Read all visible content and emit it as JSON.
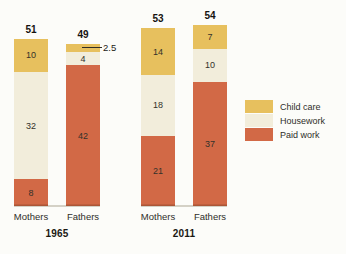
{
  "chart_data": {
    "type": "bar",
    "stacked": true,
    "series_order_top_to_bottom": [
      "Child care",
      "Housework",
      "Paid work"
    ],
    "series_colors": {
      "Child care": "#E7C05E",
      "Housework": "#F2EDDB",
      "Paid work": "#D26946"
    },
    "groups": [
      {
        "year_label": "1965",
        "bars": [
          {
            "category": "Mothers",
            "total": 51,
            "total_label": "51",
            "segments": [
              {
                "series": "Child care",
                "value": 10,
                "label": "10"
              },
              {
                "series": "Housework",
                "value": 32,
                "label": "32"
              },
              {
                "series": "Paid work",
                "value": 8,
                "label": "8"
              }
            ]
          },
          {
            "category": "Fathers",
            "total": 49,
            "total_label": "49",
            "segments": [
              {
                "series": "Child care",
                "value": 2.5,
                "label": "",
                "callout_label": "2.5"
              },
              {
                "series": "Housework",
                "value": 4,
                "label": "4"
              },
              {
                "series": "Paid work",
                "value": 42,
                "label": "42"
              }
            ]
          }
        ]
      },
      {
        "year_label": "2011",
        "bars": [
          {
            "category": "Mothers",
            "total": 53,
            "total_label": "53",
            "segments": [
              {
                "series": "Child care",
                "value": 14,
                "label": "14"
              },
              {
                "series": "Housework",
                "value": 18,
                "label": "18"
              },
              {
                "series": "Paid work",
                "value": 21,
                "label": "21"
              }
            ]
          },
          {
            "category": "Fathers",
            "total": 54,
            "total_label": "54",
            "segments": [
              {
                "series": "Child care",
                "value": 7,
                "label": "7"
              },
              {
                "series": "Housework",
                "value": 10,
                "label": "10"
              },
              {
                "series": "Paid work",
                "value": 37,
                "label": "37"
              }
            ]
          }
        ]
      }
    ],
    "legend": {
      "position": "right",
      "items": [
        {
          "label": "Child care",
          "color": "#E7C05E"
        },
        {
          "label": "Housework",
          "color": "#F2EDDB"
        },
        {
          "label": "Paid work",
          "color": "#D26946"
        }
      ]
    },
    "layout": {
      "px_per_unit": 3.35,
      "baseline_y": 206,
      "bar_width": 34,
      "bar_x": [
        14,
        66,
        141,
        193
      ],
      "callout": {
        "line_offset_x": 16,
        "line_length": 20,
        "text_offset_x": 37
      }
    },
    "colors": {
      "background": "#FCFCF9",
      "baseline": "#D4D1C6",
      "segment_text": "#33312A",
      "total_text": "#151310"
    }
  }
}
